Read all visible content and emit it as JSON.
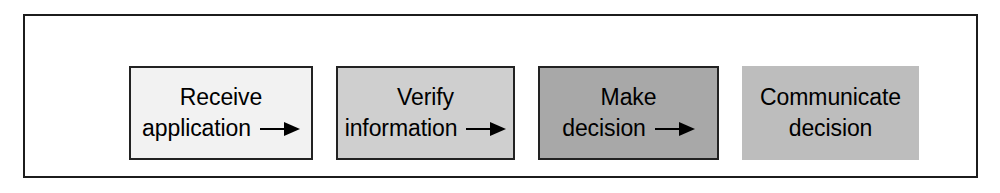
{
  "diagram": {
    "type": "linear-process-flow",
    "orientation": "horizontal",
    "frame": {
      "border_color": "#1c1c1c",
      "background_color": "#ffffff"
    },
    "arrow_glyph": "→",
    "steps": [
      {
        "index": 1,
        "line1": "Receive",
        "line2": "application",
        "full_label": "Receive application",
        "fill_color": "#f2f2f2",
        "border_color": "#222222",
        "has_border": true,
        "has_arrow": true
      },
      {
        "index": 2,
        "line1": "Verify",
        "line2": "information",
        "full_label": "Verify information",
        "fill_color": "#cfcfcf",
        "border_color": "#222222",
        "has_border": true,
        "has_arrow": true
      },
      {
        "index": 3,
        "line1": "Make",
        "line2": "decision",
        "full_label": "Make decision",
        "fill_color": "#a8a8a8",
        "border_color": "#222222",
        "has_border": true,
        "has_arrow": true
      },
      {
        "index": 4,
        "line1": "Communicate",
        "line2": "decision",
        "full_label": "Communicate decision",
        "fill_color": "#bdbdbd",
        "border_color": "none",
        "has_border": false,
        "has_arrow": false
      }
    ]
  }
}
